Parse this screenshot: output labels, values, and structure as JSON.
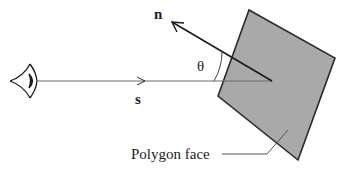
{
  "diagram": {
    "labels": {
      "normal": "n",
      "view": "s",
      "angle": "θ",
      "polygon": "Polygon face"
    },
    "colors": {
      "polygon_fill": "#a9a9a9",
      "stroke": "#2a2a2a",
      "thin_line": "#6a6a6a"
    },
    "icons": {
      "viewer": "eye-icon"
    }
  }
}
